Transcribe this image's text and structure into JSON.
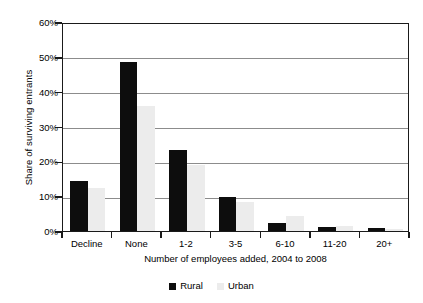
{
  "chart_data": {
    "type": "bar",
    "title": "",
    "subtitle": "",
    "xlabel": "Number of employees added, 2004 to 2008",
    "ylabel": "Share of surviving entrants",
    "categories": [
      "Decline",
      "None",
      "1-2",
      "3-5",
      "6-10",
      "11-20",
      "20+"
    ],
    "series": [
      {
        "name": "Rural",
        "color": "#0d0d0d",
        "values": [
          14.5,
          48.5,
          23.3,
          9.8,
          2.2,
          1.1,
          0.9
        ]
      },
      {
        "name": "Urban",
        "color": "#ececec",
        "values": [
          12.4,
          36.0,
          19.0,
          8.3,
          4.2,
          1.3,
          0.5
        ]
      }
    ],
    "ylim": [
      0,
      60
    ],
    "ytick_values": [
      0,
      10,
      20,
      30,
      40,
      50,
      60
    ],
    "ytick_labels": [
      "0%",
      "10%",
      "20%",
      "30%",
      "40%",
      "50%",
      "60%"
    ],
    "grid": true,
    "grid_axis": "y",
    "legend_position": "bottom",
    "value_suffix": "%"
  },
  "legend": {
    "entries": [
      {
        "label": "Rural",
        "swatch": "rural-swatch"
      },
      {
        "label": "Urban",
        "swatch": "urban-swatch"
      }
    ]
  },
  "colors": {
    "rural": "#0d0d0d",
    "urban": "#ececec",
    "gridline": "#8c8c8c",
    "axis": "#1a1a1a",
    "background": "#ffffff"
  }
}
